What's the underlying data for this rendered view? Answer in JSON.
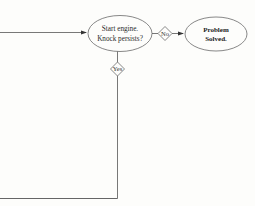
{
  "diagram": {
    "type": "flowchart",
    "nodes": {
      "start_engine": {
        "shape": "ellipse",
        "line1": "Start engine.",
        "line2": "Knock persists?"
      },
      "problem_solved": {
        "shape": "ellipse",
        "line1": "Problem",
        "line2": "Solved.",
        "bold": true
      }
    },
    "decisions": {
      "no": {
        "label": "No"
      },
      "yes": {
        "label": "Yes"
      }
    },
    "edges": [
      {
        "from": "offscreen-left",
        "to": "start_engine",
        "arrow": true
      },
      {
        "from": "start_engine",
        "to": "problem_solved",
        "via": "no",
        "arrow": true
      },
      {
        "from": "start_engine",
        "to": "offscreen-left-bottom",
        "via": "yes",
        "arrow": false
      }
    ],
    "colors": {
      "line": "#555555",
      "stroke": "#6a6a6a",
      "background": "#fdfdfb"
    }
  }
}
